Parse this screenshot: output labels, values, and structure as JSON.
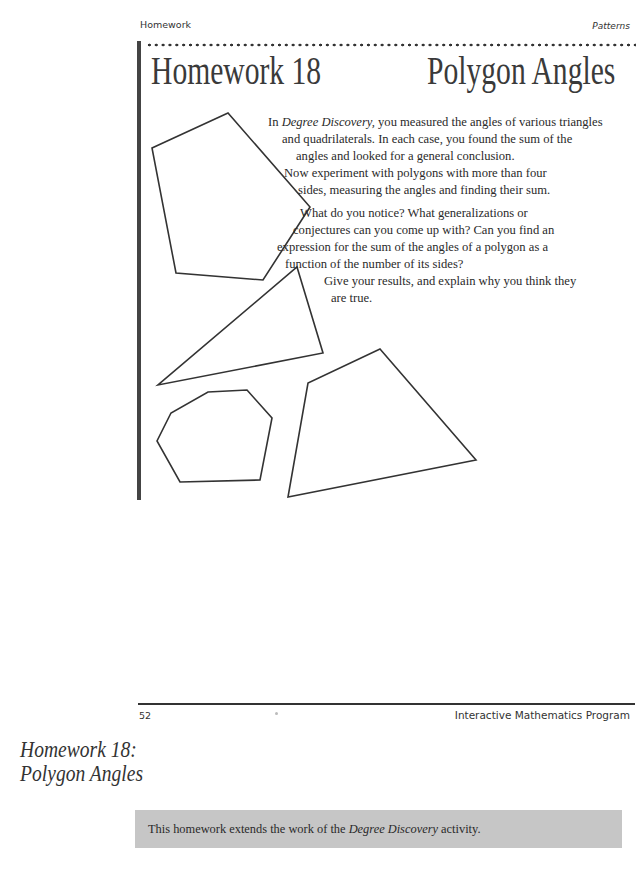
{
  "header": {
    "running_left": "Homework",
    "running_right": "Patterns"
  },
  "title": {
    "left": "Homework 18",
    "right": "Polygon Angles"
  },
  "body": {
    "p1": {
      "intro_em": "Degree Discovery,",
      "line1_rest": " you measured the angles of various triangles",
      "line2": "and quadrilaterals. In each case, you found the sum of the",
      "line3": "angles and looked for a general conclusion."
    },
    "p2": {
      "line1": "Now experiment with polygons with more than four",
      "line2": "sides, measuring the angles and finding their sum."
    },
    "p3": {
      "line1": "What do you notice? What generalizations or",
      "line2": "conjectures can you come up with? Can you find an",
      "line3": "expression for the sum of the angles of a polygon as a",
      "line4": "function of the number of its sides?"
    },
    "p4": {
      "line1": "Give your results, and explain why you think they",
      "line2": "are true."
    },
    "p1_prefix": "In "
  },
  "figures": {
    "shapes": [
      "pentagon",
      "triangle",
      "heptagon",
      "quadrilateral"
    ]
  },
  "footer": {
    "page_number": "52",
    "publisher": "Interactive Mathematics Program"
  },
  "margin_title": {
    "line1": "Homework 18:",
    "line2": "Polygon Angles"
  },
  "note": {
    "prefix": "This homework extends the work of the ",
    "em": "Degree Discovery",
    "suffix": " activity."
  }
}
